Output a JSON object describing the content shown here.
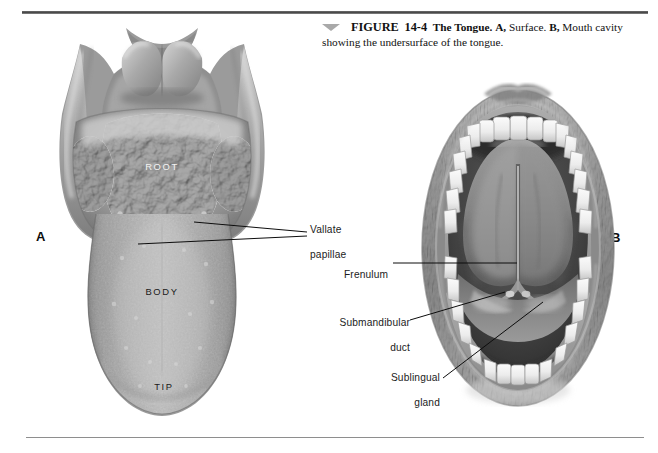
{
  "page": {
    "background_color": "#ffffff",
    "rule_color": "#4a4a4a"
  },
  "caption": {
    "marker_icon": "triangle-down-icon",
    "figure_word": "FIGURE",
    "figure_number": "14-4",
    "title": "The Tongue.",
    "part_a_letter": "A,",
    "part_a_text": "Surface.",
    "part_b_letter": "B,",
    "part_b_text": "Mouth cavity showing the undersurface of the tongue."
  },
  "panels": {
    "a_letter": "A",
    "b_letter": "B"
  },
  "figure_a": {
    "name": "tongue-dorsal-surface-illustration",
    "region_labels": [
      {
        "text": "ROOT",
        "color": "#f2f2f2"
      },
      {
        "text": "BODY",
        "color": "#1a1a1a"
      },
      {
        "text": "TIP",
        "color": "#1a1a1a"
      }
    ],
    "annotation": {
      "line1": "Vallate",
      "line2": "papillae"
    }
  },
  "figure_b": {
    "name": "mouth-cavity-undersurface-illustration",
    "annotations": [
      {
        "line1": "Frenulum",
        "line2": ""
      },
      {
        "line1": "Submandibular",
        "line2": "duct"
      },
      {
        "line1": "Sublingual",
        "line2": "gland"
      }
    ]
  }
}
